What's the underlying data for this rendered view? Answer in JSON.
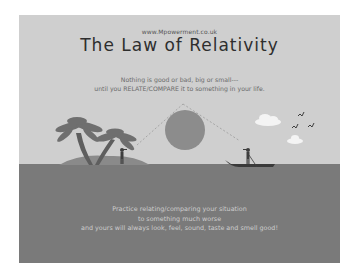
{
  "poster": {
    "url": "www.Mpowerment.co.uk",
    "title": "The Law of Relativity",
    "subtitle_lines": [
      "Nothing is good or bad, big or small---",
      "until you RELATE/COMPARE it to something in your life."
    ],
    "footer_lines": [
      "Practice relating/comparing your situation",
      "to something much worse",
      "and yours will always look, feel, sound, taste and smell good!"
    ]
  },
  "illustration": {
    "elements": [
      "palm-trees",
      "island",
      "man-on-island",
      "sun",
      "dashed-triangle-lines",
      "boat",
      "man-in-boat",
      "clouds",
      "birds",
      "sea"
    ],
    "colors": {
      "background": "#ffffff",
      "sky": "#cfcfcf",
      "sea": "#7a7a7a",
      "island": "#8a8a8a",
      "sun": "#8c8c8c",
      "palm": "#6b6b6b",
      "figures": "#3e3e3e",
      "cloud": "#f4f4f4",
      "title_text": "#2e2e2e",
      "footer_text": "#cdcdcd"
    }
  }
}
